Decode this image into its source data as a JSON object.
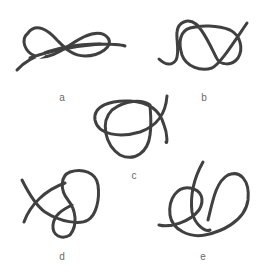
{
  "figure": {
    "stroke_color": "#404040",
    "label_color": "#6a6a6a",
    "background": "#ffffff",
    "knots": [
      {
        "id": "a",
        "label": "a",
        "label_pos": [
          62,
          92
        ]
      },
      {
        "id": "b",
        "label": "b",
        "label_pos": [
          204,
          92
        ]
      },
      {
        "id": "c",
        "label": "c",
        "label_pos": [
          134,
          170
        ]
      },
      {
        "id": "d",
        "label": "d",
        "label_pos": [
          62,
          251
        ]
      },
      {
        "id": "e",
        "label": "e",
        "label_pos": [
          203,
          251
        ]
      }
    ]
  }
}
